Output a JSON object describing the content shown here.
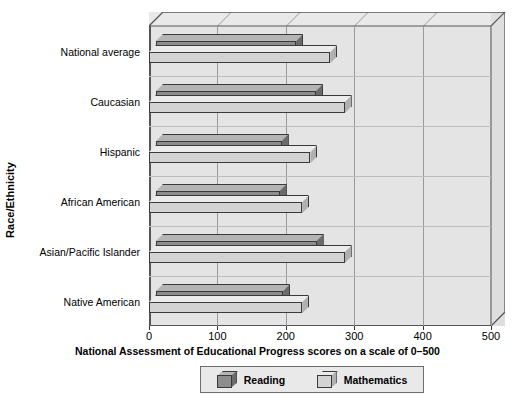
{
  "chart_data": {
    "type": "bar",
    "orientation": "horizontal",
    "title": "",
    "xlabel": "National Assessment of Educational Progress scores on a scale of 0–500",
    "ylabel": "Race/Ethnicity",
    "categories": [
      "National average",
      "Caucasian",
      "Hispanic",
      "African American",
      "Asian/Pacific Islander",
      "Native American"
    ],
    "series": [
      {
        "name": "Reading",
        "values": [
          215,
          244,
          194,
          191,
          245,
          196
        ],
        "color": "#8d8d8d"
      },
      {
        "name": "Mathematics",
        "values": [
          265,
          286,
          236,
          224,
          286,
          224
        ],
        "color": "#d3d3d3"
      }
    ],
    "xlim": [
      0,
      500
    ],
    "xticks": [
      0,
      100,
      200,
      300,
      400,
      500
    ],
    "xtick_labels": [
      "0",
      "100",
      "200",
      "300",
      "400",
      "500"
    ],
    "grid": "vertical",
    "legend_position": "bottom",
    "style": "3d"
  },
  "legend": {
    "items": [
      {
        "label": "Reading",
        "swatch": "reading-swatch-icon"
      },
      {
        "label": "Mathematics",
        "swatch": "mathematics-swatch-icon"
      }
    ]
  },
  "colors": {
    "reading": "#8d8d8d",
    "mathematics": "#d3d3d3",
    "plot_background": "#e4e4e4",
    "frame": "#555555",
    "gridline": "#9a9a9a"
  }
}
